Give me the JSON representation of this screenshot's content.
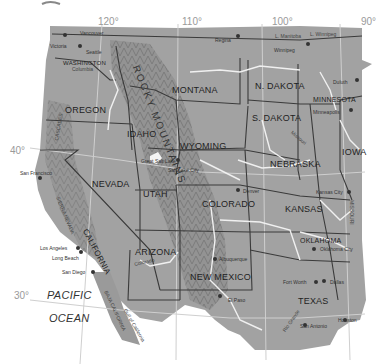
{
  "map": {
    "type": "physical-political",
    "region": "Western United States",
    "palette": {
      "land": "#9c9c9c",
      "land_dark": "#7e7e7e",
      "background": "#ffffff",
      "borders": "#3c3c3c",
      "rivers": "#f2f2f2",
      "graticule": "#d0d0d0",
      "text": "#2a2a2a",
      "degree_labels": "#9a9a9a"
    },
    "graticule": {
      "longitudes": [
        "120°",
        "110°",
        "100°",
        "90°"
      ],
      "latitudes": [
        "40°",
        "30°"
      ]
    },
    "states": [
      "WASHINGTON",
      "OREGON",
      "IDAHO",
      "MONTANA",
      "WYOMING",
      "N. DAKOTA",
      "S. DAKOTA",
      "MINNESOTA",
      "NEBRASKA",
      "IOWA",
      "NEVADA",
      "UTAH",
      "COLORADO",
      "KANSAS",
      "CALIFORNIA",
      "ARIZONA",
      "NEW MEXICO",
      "OKLAHOMA",
      "TEXAS",
      "MISSOURI"
    ],
    "cities": [
      "Vancouver",
      "Victoria",
      "Seattle",
      "Regina",
      "Winnipeg",
      "Duluth",
      "Minneapolis",
      "San Francisco",
      "Great Salt Lake",
      "Salt Lake City",
      "Denver",
      "Kansas City",
      "Los Angeles",
      "Long Beach",
      "San Diego",
      "Albuquerque",
      "El Paso",
      "Oklahoma City",
      "Fort Worth",
      "Dallas",
      "San Antonio",
      "Houston"
    ],
    "features": [
      "ROCKY MOUNTAINS",
      "SIERRA NEVADA",
      "CASCADES",
      "BAJA CALIFORNIA",
      "Gulf of California",
      "Columbia",
      "Missouri",
      "L. Manitoba",
      "L. Winnipeg",
      "Colorado",
      "Rio Grande"
    ],
    "water": {
      "ocean_line1": "PACIFIC",
      "ocean_line2": "OCEAN"
    }
  }
}
